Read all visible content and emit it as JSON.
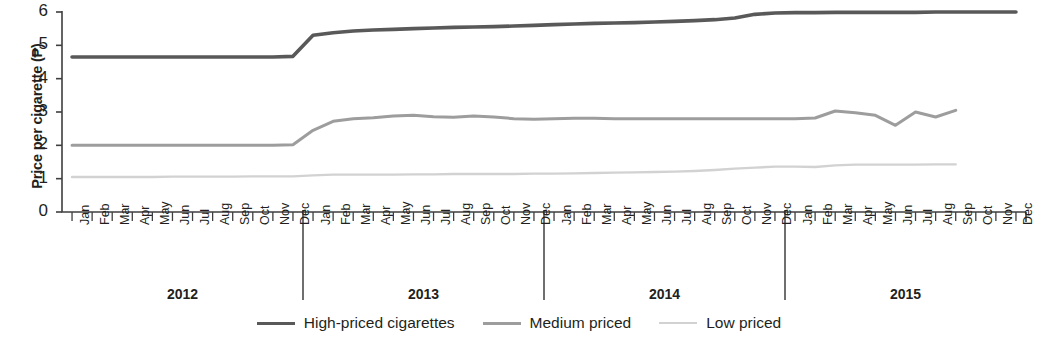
{
  "axes": {
    "ylabel": "Price per cigarette (₱)",
    "yticks": [
      "0",
      "1",
      "2",
      "3",
      "4",
      "5",
      "6"
    ],
    "ymin": 0,
    "ymax": 6,
    "months": [
      "Jan",
      "Feb",
      "Mar",
      "Apr",
      "May",
      "Jun",
      "Jul",
      "Aug",
      "Sep",
      "Oct",
      "Nov",
      "Dec"
    ],
    "years": [
      "2012",
      "2013",
      "2014",
      "2015"
    ]
  },
  "legend": {
    "items": [
      {
        "label": "High-priced cigarettes",
        "color": "#595959",
        "width": 3.6
      },
      {
        "label": "Medium priced",
        "color": "#9d9d9d",
        "width": 3.0
      },
      {
        "label": "Low priced",
        "color": "#d2d2d2",
        "width": 2.4
      }
    ]
  },
  "chart_data": {
    "type": "line",
    "title": "",
    "xlabel": "",
    "ylabel": "Price per cigarette (₱)",
    "ylim": [
      0,
      6
    ],
    "grid": false,
    "legend_position": "bottom",
    "x": [
      "Jan 2012",
      "Feb 2012",
      "Mar 2012",
      "Apr 2012",
      "May 2012",
      "Jun 2012",
      "Jul 2012",
      "Aug 2012",
      "Sep 2012",
      "Oct 2012",
      "Nov 2012",
      "Dec 2012",
      "Jan 2013",
      "Feb 2013",
      "Mar 2013",
      "Apr 2013",
      "May 2013",
      "Jun 2013",
      "Jul 2013",
      "Aug 2013",
      "Sep 2013",
      "Oct 2013",
      "Nov 2013",
      "Dec 2013",
      "Jan 2014",
      "Feb 2014",
      "Mar 2014",
      "Apr 2014",
      "May 2014",
      "Jun 2014",
      "Jul 2014",
      "Aug 2014",
      "Sep 2014",
      "Oct 2014",
      "Nov 2014",
      "Dec 2014",
      "Jan 2015",
      "Feb 2015",
      "Mar 2015",
      "Apr 2015",
      "May 2015",
      "Jun 2015",
      "Jul 2015",
      "Aug 2015",
      "Sep 2015",
      "Oct 2015",
      "Nov 2015",
      "Dec 2015"
    ],
    "series": [
      {
        "name": "High-priced cigarettes",
        "color": "#595959",
        "values": [
          4.65,
          4.65,
          4.65,
          4.65,
          4.65,
          4.65,
          4.65,
          4.65,
          4.65,
          4.65,
          4.65,
          4.67,
          5.3,
          5.38,
          5.43,
          5.46,
          5.48,
          5.5,
          5.52,
          5.54,
          5.55,
          5.56,
          5.58,
          5.6,
          5.62,
          5.64,
          5.66,
          5.67,
          5.68,
          5.7,
          5.72,
          5.74,
          5.77,
          5.82,
          5.93,
          5.97,
          5.98,
          5.98,
          5.99,
          5.99,
          5.99,
          5.99,
          5.99,
          6.0,
          6.0,
          6.0,
          6.0,
          6.0
        ]
      },
      {
        "name": "Medium priced",
        "color": "#9d9d9d",
        "values": [
          2.0,
          2.0,
          2.0,
          2.0,
          2.0,
          2.0,
          2.0,
          2.0,
          2.0,
          2.0,
          2.0,
          2.02,
          2.45,
          2.72,
          2.8,
          2.83,
          2.88,
          2.9,
          2.86,
          2.84,
          2.88,
          2.85,
          2.8,
          2.78,
          2.8,
          2.81,
          2.81,
          2.8,
          2.8,
          2.8,
          2.8,
          2.8,
          2.8,
          2.8,
          2.8,
          2.8,
          2.8,
          2.82,
          3.03,
          2.98,
          2.9,
          2.6,
          3.0,
          2.85,
          3.05,
          null,
          null,
          null
        ]
      },
      {
        "name": "Low priced",
        "color": "#d2d2d2",
        "values": [
          1.05,
          1.05,
          1.05,
          1.05,
          1.05,
          1.06,
          1.06,
          1.06,
          1.06,
          1.07,
          1.07,
          1.07,
          1.1,
          1.12,
          1.12,
          1.12,
          1.12,
          1.13,
          1.13,
          1.14,
          1.14,
          1.14,
          1.14,
          1.15,
          1.15,
          1.16,
          1.17,
          1.18,
          1.19,
          1.2,
          1.21,
          1.23,
          1.26,
          1.3,
          1.33,
          1.36,
          1.36,
          1.35,
          1.4,
          1.42,
          1.42,
          1.42,
          1.42,
          1.43,
          1.43,
          null,
          null,
          null
        ]
      }
    ]
  }
}
